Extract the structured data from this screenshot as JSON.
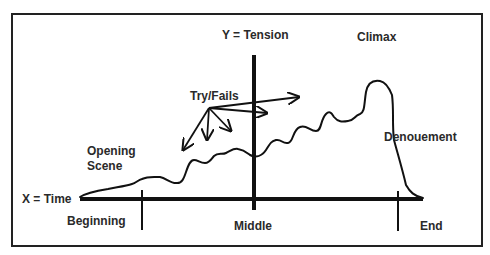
{
  "diagram": {
    "type": "plot-structure-curve",
    "axes": {
      "x_label": "X = Time",
      "y_label": "Y = Tension"
    },
    "segments": {
      "beginning": "Beginning",
      "middle": "Middle",
      "end": "End"
    },
    "annotations": {
      "opening_scene_line1": "Opening",
      "opening_scene_line2": "Scene",
      "try_fails": "Try/Fails",
      "climax": "Climax",
      "denouement": "Denouement"
    },
    "colors": {
      "line": "#111111",
      "text": "#2a2a2a",
      "background": "#ffffff"
    }
  }
}
